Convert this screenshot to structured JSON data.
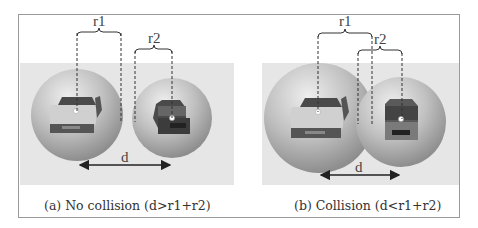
{
  "panels": [
    {
      "id": "a",
      "caption": "(a) No collision (d>r1+r2)",
      "labels": {
        "r1": "r1",
        "r2": "r2",
        "d": "d"
      },
      "state": "no-collision"
    },
    {
      "id": "b",
      "caption": "(b) Collision (d<r1+r2)",
      "labels": {
        "r1": "r1",
        "r2": "r2",
        "d": "d"
      },
      "state": "collision"
    }
  ],
  "colors": {
    "frame": "#9a9a9a",
    "band": "#e6e6e6",
    "sphere": "#b9b9b9",
    "car_dark": "#4a4a4a",
    "car_light": "#d8d8d8",
    "line": "#333333"
  }
}
